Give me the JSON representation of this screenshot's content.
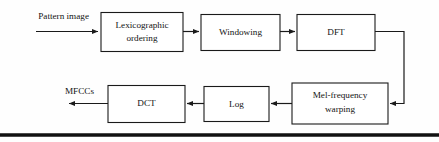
{
  "diagram": {
    "type": "flowchart",
    "background_color": "#fefefe",
    "stroke_color": "#1a1a1a",
    "box_fill_color": "#ffffff",
    "inputs": [
      {
        "id": "pattern-image",
        "label": "Pattern image"
      }
    ],
    "outputs": [
      {
        "id": "mfccs",
        "label": "MFCCs"
      }
    ],
    "blocks": [
      {
        "id": "lexicographic-ordering",
        "line1": "Lexicographic",
        "line2": "ordering"
      },
      {
        "id": "windowing",
        "line1": "Windowing",
        "line2": ""
      },
      {
        "id": "dft",
        "line1": "DFT",
        "line2": ""
      },
      {
        "id": "mel-frequency-warping",
        "line1": "Mel-frequency",
        "line2": "warping"
      },
      {
        "id": "log",
        "line1": "Log",
        "line2": ""
      },
      {
        "id": "dct",
        "line1": "DCT",
        "line2": ""
      }
    ],
    "flow_order": [
      "Pattern image",
      "Lexicographic ordering",
      "Windowing",
      "DFT",
      "Mel-frequency warping",
      "Log",
      "DCT",
      "MFCCs"
    ]
  }
}
